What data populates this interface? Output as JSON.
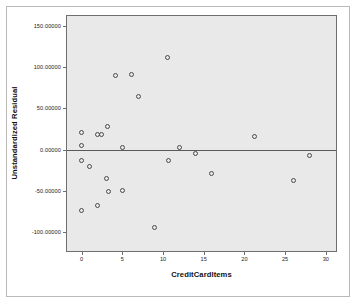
{
  "chart_data": {
    "type": "scatter",
    "title": "",
    "xlabel": "CreditCardItems",
    "ylabel": "Unstandardized Residual",
    "xlim": [
      -1.8,
      31.5
    ],
    "ylim": [
      -125.0,
      162.0
    ],
    "grid": false,
    "legend": null,
    "x_ticks": [
      0,
      5,
      10,
      15,
      20,
      25,
      30
    ],
    "x_tick_labels": [
      "0",
      "5",
      "10",
      "15",
      "20",
      "25",
      "30"
    ],
    "y_ticks": [
      150,
      100,
      50,
      0,
      -50,
      -100
    ],
    "y_tick_labels": [
      "150.00000",
      "100.00000",
      "50.00000",
      "0.00000",
      "-50.00000",
      "-100.00000"
    ],
    "reference_line": {
      "type": "horizontal",
      "y": 0.0,
      "color": "#5a5a5a"
    },
    "marker": {
      "shape": "open-circle",
      "edge_color": "#4a4a4a",
      "fill": "none",
      "size": 5
    },
    "panel_background": "#e9e9e9",
    "panel_border": "#6f6f6f",
    "figure_background": "#ffffff",
    "n_points": 27,
    "points": [
      {
        "x": 0.0,
        "y": 21.0
      },
      {
        "x": 0.0,
        "y": 5.0
      },
      {
        "x": 0.0,
        "y": -13.0
      },
      {
        "x": 0.0,
        "y": -73.0
      },
      {
        "x": 1.0,
        "y": -20.0
      },
      {
        "x": 2.0,
        "y": 19.0
      },
      {
        "x": 2.0,
        "y": -67.0
      },
      {
        "x": 2.5,
        "y": 19.0
      },
      {
        "x": 3.0,
        "y": -35.0
      },
      {
        "x": 3.2,
        "y": 28.0
      },
      {
        "x": 3.3,
        "y": -50.0
      },
      {
        "x": 4.2,
        "y": 90.0
      },
      {
        "x": 5.0,
        "y": 3.0
      },
      {
        "x": 5.0,
        "y": -49.0
      },
      {
        "x": 6.1,
        "y": 91.0
      },
      {
        "x": 7.0,
        "y": 65.0
      },
      {
        "x": 9.0,
        "y": -94.0
      },
      {
        "x": 10.5,
        "y": 112.0
      },
      {
        "x": 10.7,
        "y": -13.0
      },
      {
        "x": 12.0,
        "y": 3.0
      },
      {
        "x": 14.0,
        "y": -5.0
      },
      {
        "x": 16.0,
        "y": -29.0
      },
      {
        "x": 21.2,
        "y": 16.0
      },
      {
        "x": 26.0,
        "y": -37.0
      },
      {
        "x": 28.0,
        "y": -7.0
      }
    ]
  }
}
